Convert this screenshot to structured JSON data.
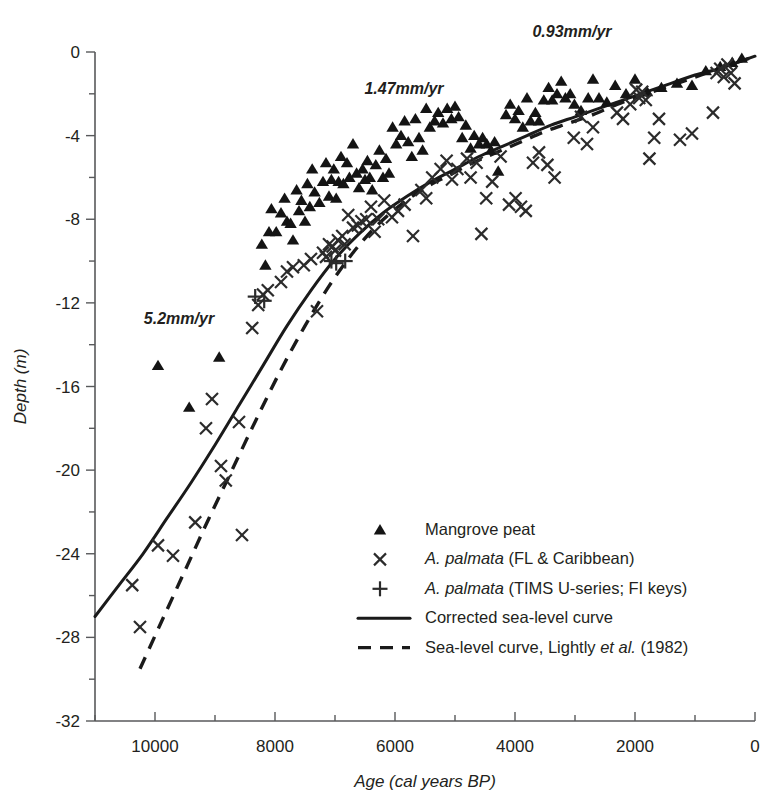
{
  "chart_data": {
    "type": "scatter",
    "title": "",
    "xlabel": "Age (cal years BP)",
    "ylabel": "Depth (m)",
    "xlim": [
      11000,
      0
    ],
    "ylim": [
      -32,
      0
    ],
    "x_ticks": [
      10000,
      8000,
      6000,
      4000,
      2000,
      0
    ],
    "x_tick_labels": [
      "10000",
      "8000",
      "6000",
      "4000",
      "2000",
      "0"
    ],
    "x_minor_step": 1000,
    "y_ticks": [
      0,
      -4,
      -8,
      -12,
      -16,
      -20,
      -24,
      -28,
      -32
    ],
    "y_tick_labels": [
      "0",
      "-4",
      "-8",
      "-12",
      "-16",
      "-20",
      "-24",
      "-28",
      "-32"
    ],
    "y_minor_step": 2,
    "grid": false,
    "legend_position": "center-right",
    "annotations": [
      {
        "text": "5.2mm/yr",
        "x": 9600,
        "y": -13.0
      },
      {
        "text": "1.47mm/yr",
        "x": 5850,
        "y": -2.0
      },
      {
        "text": "0.93mm/yr",
        "x": 3050,
        "y": 0.7
      }
    ],
    "series": [
      {
        "name": "Mangrove peat",
        "marker": "triangle",
        "points": [
          [
            9950,
            -15.0
          ],
          [
            9430,
            -17.0
          ],
          [
            8930,
            -14.6
          ],
          [
            8220,
            -9.2
          ],
          [
            8160,
            -10.2
          ],
          [
            8100,
            -8.6
          ],
          [
            8060,
            -7.5
          ],
          [
            7980,
            -8.6
          ],
          [
            7900,
            -7.7
          ],
          [
            7840,
            -7.0
          ],
          [
            7800,
            -8.1
          ],
          [
            7740,
            -8.2
          ],
          [
            7700,
            -9.0
          ],
          [
            7640,
            -6.6
          ],
          [
            7600,
            -7.6
          ],
          [
            7560,
            -7.1
          ],
          [
            7500,
            -8.1
          ],
          [
            7460,
            -6.3
          ],
          [
            7420,
            -7.4
          ],
          [
            7380,
            -5.6
          ],
          [
            7340,
            -6.7
          ],
          [
            7260,
            -7.2
          ],
          [
            7200,
            -6.2
          ],
          [
            7150,
            -5.3
          ],
          [
            7100,
            -6.9
          ],
          [
            7060,
            -6.1
          ],
          [
            7020,
            -5.6
          ],
          [
            6980,
            -7.0
          ],
          [
            6940,
            -6.2
          ],
          [
            6900,
            -5.0
          ],
          [
            6860,
            -6.3
          ],
          [
            6800,
            -5.3
          ],
          [
            6760,
            -6.0
          ],
          [
            6700,
            -4.4
          ],
          [
            6640,
            -5.8
          ],
          [
            6600,
            -6.5
          ],
          [
            6540,
            -5.6
          ],
          [
            6500,
            -6.1
          ],
          [
            6460,
            -5.2
          ],
          [
            6420,
            -6.0
          ],
          [
            6380,
            -6.6
          ],
          [
            6320,
            -5.4
          ],
          [
            6260,
            -4.7
          ],
          [
            6200,
            -6.0
          ],
          [
            6150,
            -5.1
          ],
          [
            6100,
            -5.8
          ],
          [
            6040,
            -3.6
          ],
          [
            5980,
            -4.4
          ],
          [
            5900,
            -4.0
          ],
          [
            5840,
            -3.3
          ],
          [
            5780,
            -4.3
          ],
          [
            5720,
            -5.0
          ],
          [
            5660,
            -3.2
          ],
          [
            5600,
            -4.1
          ],
          [
            5540,
            -4.7
          ],
          [
            5480,
            -2.7
          ],
          [
            5420,
            -3.6
          ],
          [
            5340,
            -3.3
          ],
          [
            5280,
            -2.9
          ],
          [
            5200,
            -3.4
          ],
          [
            5130,
            -2.7
          ],
          [
            5060,
            -3.2
          ],
          [
            5000,
            -2.6
          ],
          [
            4940,
            -3.1
          ],
          [
            4880,
            -4.1
          ],
          [
            4820,
            -3.5
          ],
          [
            4740,
            -4.6
          ],
          [
            4680,
            -4.0
          ],
          [
            4600,
            -4.4
          ],
          [
            4540,
            -4.1
          ],
          [
            4470,
            -4.4
          ],
          [
            4400,
            -4.7
          ],
          [
            4340,
            -4.3
          ],
          [
            4280,
            -5.7
          ],
          [
            4150,
            -3.0
          ],
          [
            4080,
            -2.5
          ],
          [
            4000,
            -3.2
          ],
          [
            3940,
            -2.8
          ],
          [
            3870,
            -3.6
          ],
          [
            3800,
            -2.2
          ],
          [
            3740,
            -3.3
          ],
          [
            3660,
            -2.9
          ],
          [
            3600,
            -3.3
          ],
          [
            3520,
            -2.3
          ],
          [
            3440,
            -1.7
          ],
          [
            3380,
            -2.3
          ],
          [
            3300,
            -2.0
          ],
          [
            3230,
            -1.4
          ],
          [
            3160,
            -2.2
          ],
          [
            3080,
            -2.0
          ],
          [
            3010,
            -2.5
          ],
          [
            2900,
            -2.8
          ],
          [
            2780,
            -2.2
          ],
          [
            2700,
            -1.3
          ],
          [
            2600,
            -2.2
          ],
          [
            2470,
            -2.4
          ],
          [
            2330,
            -1.6
          ],
          [
            2150,
            -2.0
          ],
          [
            2000,
            -1.3
          ],
          [
            1800,
            -1.9
          ],
          [
            1560,
            -1.7
          ],
          [
            1300,
            -1.5
          ],
          [
            1050,
            -1.6
          ],
          [
            820,
            -0.9
          ],
          [
            580,
            -0.7
          ],
          [
            380,
            -0.5
          ],
          [
            220,
            -0.3
          ]
        ]
      },
      {
        "name": "A. palmata (FL & Caribbean)",
        "marker": "x",
        "points": [
          [
            10380,
            -25.5
          ],
          [
            10250,
            -27.5
          ],
          [
            9950,
            -23.6
          ],
          [
            9700,
            -24.1
          ],
          [
            9330,
            -22.5
          ],
          [
            9150,
            -18.0
          ],
          [
            9050,
            -16.6
          ],
          [
            8900,
            -19.8
          ],
          [
            8820,
            -20.5
          ],
          [
            8600,
            -17.7
          ],
          [
            8550,
            -23.1
          ],
          [
            8380,
            -13.2
          ],
          [
            8280,
            -12.1
          ],
          [
            8200,
            -11.6
          ],
          [
            8120,
            -11.4
          ],
          [
            7900,
            -11.0
          ],
          [
            7800,
            -10.5
          ],
          [
            7700,
            -10.3
          ],
          [
            7520,
            -10.2
          ],
          [
            7400,
            -9.9
          ],
          [
            7300,
            -12.4
          ],
          [
            7200,
            -9.6
          ],
          [
            7150,
            -9.8
          ],
          [
            7100,
            -9.2
          ],
          [
            7040,
            -9.3
          ],
          [
            7000,
            -9.5
          ],
          [
            6950,
            -9.0
          ],
          [
            6880,
            -8.8
          ],
          [
            6840,
            -9.2
          ],
          [
            6780,
            -7.8
          ],
          [
            6700,
            -8.4
          ],
          [
            6620,
            -8.3
          ],
          [
            6560,
            -8.1
          ],
          [
            6480,
            -8.0
          ],
          [
            6400,
            -7.4
          ],
          [
            6340,
            -8.6
          ],
          [
            6280,
            -8.0
          ],
          [
            6180,
            -7.1
          ],
          [
            6050,
            -7.9
          ],
          [
            5950,
            -7.6
          ],
          [
            5840,
            -7.3
          ],
          [
            5700,
            -8.8
          ],
          [
            5560,
            -6.6
          ],
          [
            5480,
            -7.0
          ],
          [
            5380,
            -6.0
          ],
          [
            5240,
            -5.6
          ],
          [
            5140,
            -5.2
          ],
          [
            5050,
            -6.1
          ],
          [
            4960,
            -5.6
          ],
          [
            4800,
            -5.1
          ],
          [
            4740,
            -6.0
          ],
          [
            4640,
            -5.3
          ],
          [
            4560,
            -8.7
          ],
          [
            4480,
            -7.0
          ],
          [
            4380,
            -6.2
          ],
          [
            4240,
            -5.0
          ],
          [
            4100,
            -7.3
          ],
          [
            3990,
            -7.0
          ],
          [
            3900,
            -7.4
          ],
          [
            3820,
            -7.6
          ],
          [
            3700,
            -5.3
          ],
          [
            3600,
            -4.8
          ],
          [
            3460,
            -5.4
          ],
          [
            3340,
            -6.0
          ],
          [
            3020,
            -4.1
          ],
          [
            2900,
            -3.1
          ],
          [
            2800,
            -4.4
          ],
          [
            2700,
            -3.6
          ],
          [
            2300,
            -2.9
          ],
          [
            2200,
            -3.2
          ],
          [
            2080,
            -2.5
          ],
          [
            1980,
            -1.8
          ],
          [
            1930,
            -2.2
          ],
          [
            1880,
            -1.9
          ],
          [
            1820,
            -2.3
          ],
          [
            1760,
            -5.1
          ],
          [
            1680,
            -4.1
          ],
          [
            1600,
            -3.2
          ],
          [
            1250,
            -4.2
          ],
          [
            1050,
            -3.9
          ],
          [
            700,
            -2.9
          ],
          [
            640,
            -1.0
          ],
          [
            580,
            -0.8
          ],
          [
            520,
            -1.2
          ],
          [
            460,
            -0.6
          ],
          [
            400,
            -1.0
          ],
          [
            340,
            -1.5
          ]
        ]
      },
      {
        "name": "A. palmata (TIMS U-series; FI keys)",
        "marker": "plus",
        "points": [
          [
            8330,
            -11.7
          ],
          [
            8180,
            -11.9
          ],
          [
            7060,
            -10.0
          ],
          [
            6980,
            -10.1
          ],
          [
            6830,
            -10.0
          ]
        ]
      }
    ],
    "curves": [
      {
        "name": "Corrected sea-level curve",
        "style": "solid",
        "points": [
          [
            11000,
            -27.0
          ],
          [
            10600,
            -25.5
          ],
          [
            10200,
            -24.0
          ],
          [
            9800,
            -22.3
          ],
          [
            9400,
            -20.6
          ],
          [
            9000,
            -18.8
          ],
          [
            8600,
            -16.9
          ],
          [
            8200,
            -15.0
          ],
          [
            7800,
            -13.1
          ],
          [
            7400,
            -11.4
          ],
          [
            7000,
            -9.9
          ],
          [
            6600,
            -8.7
          ],
          [
            6200,
            -7.7
          ],
          [
            5800,
            -6.9
          ],
          [
            5400,
            -6.2
          ],
          [
            5000,
            -5.6
          ],
          [
            4600,
            -5.0
          ],
          [
            4200,
            -4.5
          ],
          [
            3800,
            -4.0
          ],
          [
            3400,
            -3.5
          ],
          [
            3000,
            -3.1
          ],
          [
            2600,
            -2.7
          ],
          [
            2200,
            -2.3
          ],
          [
            1800,
            -1.9
          ],
          [
            1400,
            -1.5
          ],
          [
            1000,
            -1.1
          ],
          [
            600,
            -0.8
          ],
          [
            200,
            -0.4
          ],
          [
            0,
            -0.2
          ]
        ]
      },
      {
        "name": "Sea-level curve, Lightly et al. (1982)",
        "style": "dashed",
        "points": [
          [
            10250,
            -29.5
          ],
          [
            9900,
            -27.3
          ],
          [
            9500,
            -24.8
          ],
          [
            9100,
            -22.3
          ],
          [
            8700,
            -19.9
          ],
          [
            8300,
            -17.5
          ],
          [
            7900,
            -15.2
          ],
          [
            7500,
            -13.1
          ],
          [
            7100,
            -11.2
          ],
          [
            6700,
            -9.6
          ],
          [
            6300,
            -8.3
          ],
          [
            5900,
            -7.3
          ],
          [
            5500,
            -6.5
          ],
          [
            5100,
            -5.9
          ],
          [
            4700,
            -5.3
          ],
          [
            4300,
            -4.8
          ],
          [
            3900,
            -4.3
          ],
          [
            3500,
            -3.8
          ],
          [
            3100,
            -3.4
          ],
          [
            2700,
            -3.0
          ],
          [
            2300,
            -2.5
          ],
          [
            1900,
            -2.1
          ],
          [
            1500,
            -1.7
          ],
          [
            1100,
            -1.3
          ],
          [
            700,
            -0.9
          ],
          [
            300,
            -0.5
          ],
          [
            100,
            -0.3
          ]
        ]
      }
    ],
    "legend": [
      {
        "marker": "triangle",
        "label": "Mangrove peat",
        "italic_prefix": ""
      },
      {
        "marker": "x",
        "label_italic": "A. palmata",
        "label_rest": " (FL & Caribbean)"
      },
      {
        "marker": "plus",
        "label_italic": "A. palmata",
        "label_rest": " (TIMS U-series; FI keys)"
      },
      {
        "marker": "line-solid",
        "label": "Corrected sea-level curve"
      },
      {
        "marker": "line-dashed",
        "label_pre": "Sea-level curve, Lightly ",
        "label_italic": "et al.",
        "label_post": " (1982)"
      }
    ]
  }
}
